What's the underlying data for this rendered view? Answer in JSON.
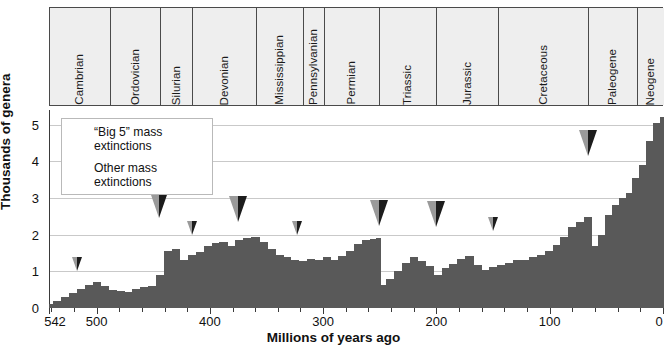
{
  "chart_data": {
    "type": "area",
    "title": "",
    "xlabel": "Millions of years ago",
    "ylabel": "Thousands of genera",
    "xlim": [
      542,
      0
    ],
    "ylim": [
      0,
      5.4
    ],
    "x_reversed": true,
    "x_ticks_major": [
      542,
      500,
      400,
      300,
      200,
      100,
      0
    ],
    "x_tick_labels": [
      "542",
      "500",
      "400",
      "300",
      "200",
      "100",
      "0"
    ],
    "x_ticks_minor_step": 20,
    "y_ticks": [
      0,
      1,
      2,
      3,
      4,
      5
    ],
    "y_tick_labels": [
      "0",
      "1",
      "2",
      "3",
      "4",
      "5"
    ],
    "grid": "horizontal",
    "units": "thousands of genera",
    "series_name": "Marine animal genera diversity",
    "x": [
      542,
      535,
      528,
      521,
      514,
      507,
      500,
      493,
      486,
      479,
      472,
      465,
      458,
      451,
      444,
      437,
      430,
      423,
      416,
      409,
      402,
      395,
      388,
      381,
      374,
      367,
      360,
      353,
      346,
      339,
      332,
      325,
      318,
      311,
      304,
      297,
      290,
      283,
      276,
      269,
      262,
      255,
      251,
      248,
      241,
      234,
      227,
      220,
      213,
      206,
      199,
      192,
      185,
      178,
      171,
      164,
      157,
      150,
      143,
      136,
      129,
      122,
      115,
      108,
      101,
      94,
      87,
      80,
      73,
      66,
      60,
      54,
      48,
      42,
      36,
      30,
      24,
      18,
      12,
      6,
      0
    ],
    "values": [
      0.1,
      0.18,
      0.3,
      0.42,
      0.52,
      0.62,
      0.72,
      0.6,
      0.48,
      0.46,
      0.44,
      0.52,
      0.58,
      0.6,
      0.9,
      1.55,
      1.62,
      1.3,
      1.45,
      1.52,
      1.7,
      1.78,
      1.8,
      1.7,
      1.85,
      1.9,
      1.95,
      1.8,
      1.6,
      1.45,
      1.38,
      1.32,
      1.28,
      1.34,
      1.3,
      1.38,
      1.3,
      1.42,
      1.55,
      1.75,
      1.85,
      1.88,
      1.9,
      0.62,
      0.8,
      1.02,
      1.22,
      1.4,
      1.28,
      1.15,
      0.9,
      1.08,
      1.2,
      1.35,
      1.42,
      1.18,
      1.05,
      1.12,
      1.18,
      1.22,
      1.3,
      1.32,
      1.38,
      1.45,
      1.55,
      1.72,
      1.95,
      2.2,
      2.35,
      2.48,
      1.7,
      2.0,
      2.55,
      2.8,
      3.0,
      3.15,
      3.55,
      3.9,
      4.55,
      5.05,
      5.2
    ],
    "areas": {
      "fill_color": "#595959"
    }
  },
  "periods": [
    {
      "name": "Cambrian",
      "start": 542,
      "end": 488
    },
    {
      "name": "Ordovician",
      "start": 488,
      "end": 444
    },
    {
      "name": "Silurian",
      "start": 444,
      "end": 416
    },
    {
      "name": "Devonian",
      "start": 416,
      "end": 359
    },
    {
      "name": "Mississippian",
      "start": 359,
      "end": 318
    },
    {
      "name": "Pennsylvanian",
      "start": 318,
      "end": 299
    },
    {
      "name": "Permian",
      "start": 299,
      "end": 251
    },
    {
      "name": "Triassic",
      "start": 251,
      "end": 200
    },
    {
      "name": "Jurassic",
      "start": 200,
      "end": 146
    },
    {
      "name": "Cretaceous",
      "start": 146,
      "end": 66
    },
    {
      "name": "Paleogene",
      "start": 66,
      "end": 23
    },
    {
      "name": "Neogene",
      "start": 23,
      "end": 0
    }
  ],
  "extinction_markers": [
    {
      "age": 517,
      "kind": "other",
      "y_value": 1.0
    },
    {
      "age": 445,
      "kind": "big5",
      "y_value": 2.45
    },
    {
      "age": 416,
      "kind": "other",
      "y_value": 2.0
    },
    {
      "age": 375,
      "kind": "big5",
      "y_value": 2.35
    },
    {
      "age": 323,
      "kind": "other",
      "y_value": 2.0
    },
    {
      "age": 251,
      "kind": "big5",
      "y_value": 2.25
    },
    {
      "age": 200,
      "kind": "big5",
      "y_value": 2.2
    },
    {
      "age": 150,
      "kind": "other",
      "y_value": 2.1
    },
    {
      "age": 66,
      "kind": "big5",
      "y_value": 4.15
    }
  ],
  "legend": {
    "items": [
      {
        "symbol": "big5-triangle",
        "line1": "“Big 5” mass",
        "line2": "extinctions"
      },
      {
        "symbol": "other-triangle",
        "line1": "Other mass",
        "line2": "extinctions"
      }
    ]
  },
  "colors": {
    "bar_fill": "#595959",
    "grid": "#c9c9c9",
    "axis": "#3a3a3a",
    "period_band_fill": "#eeeeee",
    "period_band_border": "#4a4a4a",
    "marker_dark": "#1c1c1c",
    "marker_light": "#9a9a9a"
  }
}
